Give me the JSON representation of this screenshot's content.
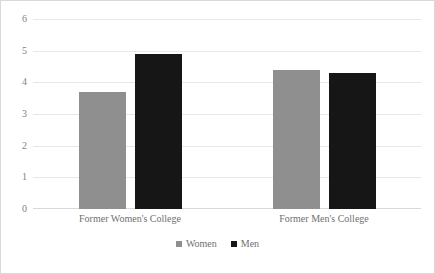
{
  "chart_data": {
    "type": "bar",
    "title": "",
    "subtitle": "",
    "xlabel": "",
    "ylabel": "",
    "categories": [
      "Former Women's College",
      "Former Men's College"
    ],
    "series": [
      {
        "name": "Women",
        "color": "#8f8f8f",
        "values": [
          3.7,
          4.4
        ]
      },
      {
        "name": "Men",
        "color": "#161616",
        "values": [
          4.9,
          4.3
        ]
      }
    ],
    "ylim": [
      0,
      6
    ],
    "yticks": [
      0,
      1,
      2,
      3,
      4,
      5,
      6
    ],
    "ytick_labels": [
      "0",
      "1",
      "2",
      "3",
      "4",
      "5",
      "6"
    ],
    "grid": true,
    "grid_axis": "y",
    "legend_position": "bottom",
    "legend_marker": "square",
    "bar_group_gap": true,
    "frame": true
  },
  "colors": {
    "frame_border": "#d9d9d9",
    "gridline": "#e8e8e8",
    "axis": "#d9d9d9",
    "tick_text": "#7f7f7f",
    "label_text": "#6f6f6f",
    "background": "#ffffff"
  }
}
